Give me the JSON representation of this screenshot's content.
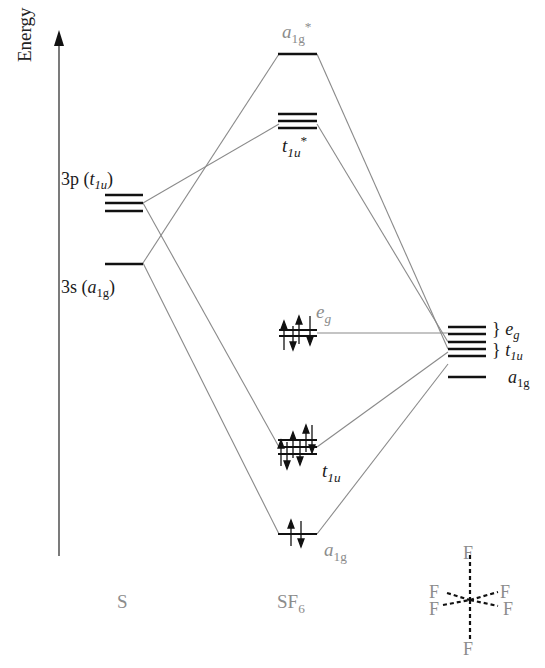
{
  "axis": {
    "label": "Energy"
  },
  "columns": {
    "left": "S",
    "middle": {
      "base": "SF",
      "sub": "6"
    },
    "right": "octahedral F6 ligand set"
  },
  "sulfur_orbitals": [
    {
      "name": "3p",
      "sym": "t",
      "sym_sub": "1u",
      "degeneracy": 3
    },
    {
      "name": "3s",
      "sym": "a",
      "sym_sub": "1g",
      "degeneracy": 1
    }
  ],
  "sf6_orbitals": [
    {
      "sym": "a",
      "sym_sub": "1g",
      "star": "*",
      "degeneracy": 1,
      "occupied": false
    },
    {
      "sym": "t",
      "sym_sub": "1u",
      "star": "*",
      "degeneracy": 3,
      "occupied": false
    },
    {
      "sym": "e",
      "sym_sub": "g",
      "degeneracy": 2,
      "occupied": true,
      "electrons": 4
    },
    {
      "sym": "t",
      "sym_sub": "1u",
      "degeneracy": 3,
      "occupied": true,
      "electrons": 6
    },
    {
      "sym": "a",
      "sym_sub": "1g",
      "degeneracy": 1,
      "occupied": true,
      "electrons": 2
    }
  ],
  "ligand_orbitals": [
    {
      "sym": "e",
      "sym_sub": "g",
      "degeneracy": 2
    },
    {
      "sym": "t",
      "sym_sub": "1u",
      "degeneracy": 3
    },
    {
      "sym": "a",
      "sym_sub": "1g",
      "degeneracy": 1
    }
  ],
  "labels": {
    "s3p": "3p",
    "s3p_paren_open": " (",
    "s3p_sym": "t",
    "s3p_sub": "1u",
    "s3p_paren_close": ")",
    "s3s": "3s",
    "s3s_paren_open": " (",
    "s3s_sym": "a",
    "s3s_sub": "1g",
    "s3s_paren_close": ")",
    "a1g_star_sym": "a",
    "a1g_star_sub": "1g",
    "a1g_star_sup": "*",
    "t1u_star_sym": "t",
    "t1u_star_sub": "1u",
    "t1u_star_sup": "*",
    "eg_sym": "e",
    "eg_sub": "g",
    "t1u_sym": "t",
    "t1u_sub": "1u",
    "a1g_sym": "a",
    "a1g_sub": "1g",
    "lig_eg_brace": "}",
    "lig_eg_sym": "e",
    "lig_eg_sub": "g",
    "lig_t1u_brace": "}",
    "lig_t1u_sym": "t",
    "lig_t1u_sub": "1u",
    "lig_a1g_sym": "a",
    "lig_a1g_sub": "1g",
    "col_S": "S",
    "col_SF": "SF",
    "col_SF_sub": "6",
    "F_top": "F",
    "F_ul": "F",
    "F_ur": "F",
    "F_ll": "F",
    "F_lr": "F",
    "F_bottom": "F"
  },
  "colors": {
    "level": "#111111",
    "connector": "#8a8a8a",
    "gray_text": "#8c8c8c",
    "dark_text": "#1a1a1a"
  }
}
